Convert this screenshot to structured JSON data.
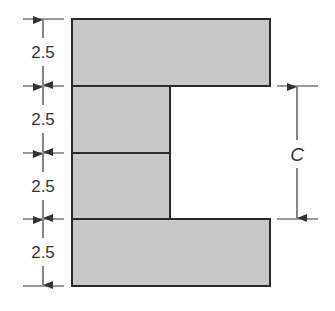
{
  "diagram": {
    "type": "C-shaped cross-section with dimensions",
    "fill_color": "#c8c8c8",
    "stroke_color": "#2a2a2a",
    "left_dimensions": [
      {
        "label": "2.5",
        "segment": "top flange"
      },
      {
        "label": "2.5",
        "segment": "upper web block"
      },
      {
        "label": "2.5",
        "segment": "lower web block"
      },
      {
        "label": "2.5",
        "segment": "bottom flange"
      }
    ],
    "right_dimension": {
      "label": "C",
      "span": "gap between flanges"
    }
  }
}
